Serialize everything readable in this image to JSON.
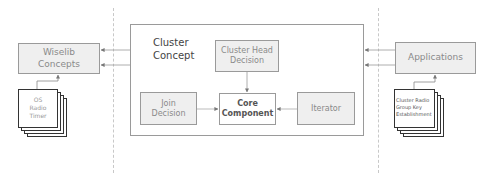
{
  "diagram": {
    "cluster_concept": {
      "title_line1": "Cluster",
      "title_line2": "Concept"
    },
    "cluster_head_decision": {
      "line1": "Cluster Head",
      "line2": "Decision"
    },
    "join_decision": {
      "line1": "Join",
      "line2": "Decision"
    },
    "core_component": {
      "line1": "Core",
      "line2": "Component"
    },
    "iterator": {
      "label": "Iterator"
    },
    "wiselib_concepts": {
      "line1": "Wiselib",
      "line2": "Concepts"
    },
    "applications": {
      "label": "Applications"
    },
    "left_docs": {
      "line1": "OS",
      "line2": "Radio",
      "line3": "Timer"
    },
    "right_docs": {
      "line1": "Cluster Radio",
      "line2": "Group Key",
      "line3": "Establishment"
    },
    "colors": {
      "box_fill": "#efefef",
      "border": "#9a9a9a",
      "text_muted": "#8a8a8a",
      "text_dark": "#444444"
    }
  }
}
